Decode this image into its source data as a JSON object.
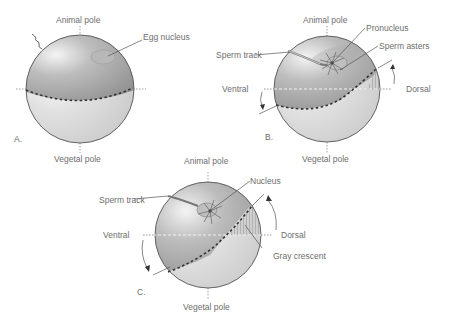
{
  "figure": {
    "panels": [
      {
        "id": "A",
        "panel_label": "A.",
        "top_label": "Animal pole",
        "bottom_label": "Vegetal pole",
        "annotations": [
          "Egg nucleus"
        ]
      },
      {
        "id": "B",
        "panel_label": "B.",
        "top_label": "Animal pole",
        "bottom_label": "Vegetal pole",
        "left_label": "Ventral",
        "right_label": "Dorsal",
        "annotations": [
          "Pronucleus",
          "Sperm asters",
          "Sperm track"
        ]
      },
      {
        "id": "C",
        "panel_label": "C.",
        "top_label": "Animal pole",
        "bottom_label": "Vegetal pole",
        "left_label": "Ventral",
        "right_label": "Dorsal",
        "annotations": [
          "Nucleus",
          "Sperm track",
          "Gray crescent"
        ]
      }
    ],
    "colors": {
      "animal_hemisphere": "#9a9a9a",
      "vegetal_hemisphere": "#d4d4d4",
      "outline": "#555555",
      "label_text": "#6e6e6e"
    }
  }
}
